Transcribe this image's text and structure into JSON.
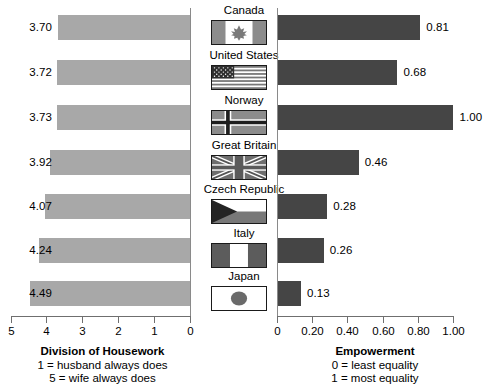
{
  "chart_data": {
    "type": "bar",
    "title": "",
    "orientation": "horizontal-paired",
    "categories": [
      "Canada",
      "United States",
      "Norway",
      "Great Britain",
      "Czech Republic",
      "Italy",
      "Japan"
    ],
    "panels": [
      {
        "name": "Division of Housework",
        "side": "left",
        "direction": "right-to-left",
        "xlabel": "Division of Housework",
        "sublabels": [
          "1 = husband always does",
          "5 = wife always does"
        ],
        "ylabel": "",
        "xlim": [
          5,
          0
        ],
        "ticks": [
          5,
          4,
          3,
          2,
          1,
          0
        ],
        "tick_labels": [
          "5",
          "4",
          "3",
          "2",
          "1",
          "0"
        ],
        "grid": false,
        "bar_color": "#a8a8a8",
        "values": [
          3.7,
          3.72,
          3.73,
          3.92,
          4.07,
          4.24,
          4.49
        ],
        "value_labels": [
          "3.70",
          "3.72",
          "3.73",
          "3.92",
          "4.07",
          "4.24",
          "4.49"
        ]
      },
      {
        "name": "Empowerment",
        "side": "right",
        "direction": "left-to-right",
        "xlabel": "Empowerment",
        "sublabels": [
          "0 = least equality",
          "1 = most equality"
        ],
        "ylabel": "",
        "xlim": [
          0,
          1.0
        ],
        "ticks": [
          0,
          0.2,
          0.4,
          0.6,
          0.8,
          1.0
        ],
        "tick_labels": [
          "0",
          "0.20",
          "0.40",
          "0.60",
          "0.80",
          "1.00"
        ],
        "grid": false,
        "bar_color": "#454545",
        "values": [
          0.81,
          0.68,
          1.0,
          0.46,
          0.28,
          0.26,
          0.13
        ],
        "value_labels": [
          "0.81",
          "0.68",
          "1.00",
          "0.46",
          "0.28",
          "0.26",
          "0.13"
        ]
      }
    ]
  },
  "flags": {
    "icons": [
      "canada-flag-icon",
      "united-states-flag-icon",
      "norway-flag-icon",
      "great-britain-flag-icon",
      "czech-republic-flag-icon",
      "italy-flag-icon",
      "japan-flag-icon"
    ]
  },
  "colors": {
    "left_bar": "#a8a8a8",
    "right_bar": "#454545",
    "axis": "#6f6f6f",
    "text": "#000000",
    "background": "#ffffff"
  }
}
